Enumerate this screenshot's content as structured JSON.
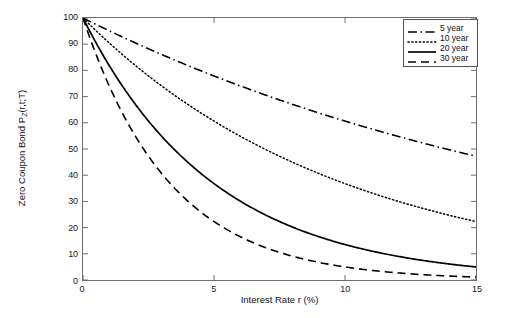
{
  "chart_data": {
    "type": "line",
    "title": "",
    "xlabel": "Interest Rate r (%)",
    "ylabel_plain": "Zero Coupon Bond P_Z(r,t;T)",
    "ylabel_main": "Zero Coupon Bond P",
    "ylabel_sub": "Z",
    "ylabel_tail": "(r,t;T)",
    "xlim": [
      0,
      15
    ],
    "ylim": [
      0,
      100
    ],
    "xticks": [
      0,
      5,
      10,
      15
    ],
    "xtick_labels": [
      "0",
      "5",
      "10",
      "15"
    ],
    "yticks": [
      0,
      10,
      20,
      30,
      40,
      50,
      60,
      70,
      80,
      90,
      100
    ],
    "ytick_labels": [
      "0",
      "10",
      "20",
      "30",
      "40",
      "50",
      "60",
      "70",
      "80",
      "90",
      "100"
    ],
    "grid": false,
    "legend_position": "top-right",
    "x": [
      0,
      0.75,
      1.5,
      2.25,
      3,
      3.75,
      4.5,
      5.25,
      6,
      6.75,
      7.5,
      8.25,
      9,
      9.75,
      10.5,
      11.25,
      12,
      12.75,
      13.5,
      14.25,
      15
    ],
    "series": [
      {
        "name": "5 year",
        "maturity_years": 5,
        "style": "dash-dot",
        "color": "#000000",
        "values": [
          100.0,
          96.3,
          92.8,
          89.4,
          86.1,
          82.9,
          79.9,
          76.9,
          74.1,
          71.4,
          68.7,
          66.2,
          63.8,
          61.4,
          59.2,
          57.0,
          54.9,
          52.9,
          50.9,
          49.1,
          47.2
        ]
      },
      {
        "name": "10 year",
        "maturity_years": 10,
        "style": "dotted",
        "color": "#000000",
        "values": [
          100.0,
          92.8,
          86.1,
          79.9,
          74.1,
          68.7,
          63.8,
          59.2,
          54.9,
          50.9,
          47.2,
          43.8,
          40.7,
          37.7,
          35.0,
          32.5,
          30.1,
          27.9,
          25.9,
          24.1,
          22.3
        ]
      },
      {
        "name": "20 year",
        "maturity_years": 20,
        "style": "solid",
        "color": "#000000",
        "values": [
          100.0,
          86.1,
          74.1,
          63.8,
          54.9,
          47.2,
          40.7,
          35.0,
          30.1,
          25.9,
          22.3,
          19.2,
          16.5,
          14.2,
          12.2,
          10.5,
          9.1,
          7.8,
          6.7,
          5.8,
          5.0
        ]
      },
      {
        "name": "30 year",
        "maturity_years": 30,
        "style": "dashed",
        "color": "#000000",
        "values": [
          100.0,
          79.9,
          63.8,
          50.9,
          40.7,
          32.5,
          25.9,
          20.7,
          16.5,
          13.2,
          10.5,
          8.4,
          6.7,
          5.4,
          4.3,
          3.4,
          2.7,
          2.2,
          1.7,
          1.4,
          1.1
        ]
      }
    ],
    "formula": "P = 100 * exp(-r*T/100)"
  },
  "legend": {
    "items": [
      {
        "label": "5 year"
      },
      {
        "label": "10 year"
      },
      {
        "label": "20 year"
      },
      {
        "label": "30 year"
      }
    ]
  }
}
